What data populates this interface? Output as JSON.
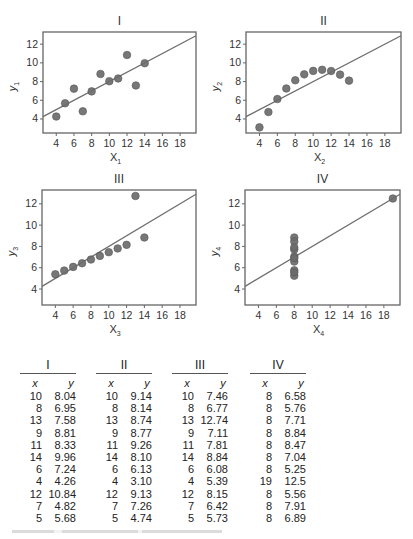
{
  "chart_data": [
    {
      "type": "scatter",
      "title": "I",
      "xlabel": "X1",
      "ylabel": "Y1",
      "xlim": [
        2.5,
        19.8
      ],
      "ylim": [
        2.5,
        13.3
      ],
      "xticks": [
        4,
        6,
        8,
        10,
        12,
        14,
        16,
        18
      ],
      "yticks": [
        4,
        6,
        8,
        10,
        12
      ],
      "x": [
        10,
        8,
        13,
        9,
        11,
        14,
        6,
        4,
        12,
        7,
        5
      ],
      "y": [
        8.04,
        6.95,
        7.58,
        8.81,
        8.33,
        9.96,
        7.24,
        4.26,
        10.84,
        4.82,
        5.68
      ],
      "fit_line": {
        "intercept": 3.0,
        "slope": 0.5
      },
      "grid": false
    },
    {
      "type": "scatter",
      "title": "II",
      "xlabel": "X2",
      "ylabel": "Y2",
      "xlim": [
        2.5,
        19.8
      ],
      "ylim": [
        2.5,
        13.3
      ],
      "xticks": [
        4,
        6,
        8,
        10,
        12,
        14,
        16,
        18
      ],
      "yticks": [
        4,
        6,
        8,
        10,
        12
      ],
      "x": [
        10,
        8,
        13,
        9,
        11,
        14,
        6,
        4,
        12,
        7,
        5
      ],
      "y": [
        9.14,
        8.14,
        8.74,
        8.77,
        9.26,
        8.1,
        6.13,
        3.1,
        9.13,
        7.26,
        4.74
      ],
      "fit_line": {
        "intercept": 3.0,
        "slope": 0.5
      },
      "grid": false
    },
    {
      "type": "scatter",
      "title": "III",
      "xlabel": "X3",
      "ylabel": "Y3",
      "xlim": [
        2.5,
        19.8
      ],
      "ylim": [
        2.5,
        13.3
      ],
      "xticks": [
        4,
        6,
        8,
        10,
        12,
        14,
        16,
        18
      ],
      "yticks": [
        4,
        6,
        8,
        10,
        12
      ],
      "x": [
        10,
        8,
        13,
        9,
        11,
        14,
        6,
        4,
        12,
        7,
        5
      ],
      "y": [
        7.46,
        6.77,
        12.74,
        7.11,
        7.81,
        8.84,
        6.08,
        5.39,
        8.15,
        6.42,
        5.73
      ],
      "fit_line": {
        "intercept": 3.0,
        "slope": 0.5
      },
      "grid": false
    },
    {
      "type": "scatter",
      "title": "IV",
      "xlabel": "X4",
      "ylabel": "Y4",
      "xlim": [
        2.5,
        19.8
      ],
      "ylim": [
        2.5,
        13.3
      ],
      "xticks": [
        4,
        6,
        8,
        10,
        12,
        14,
        16,
        18
      ],
      "yticks": [
        4,
        6,
        8,
        10,
        12
      ],
      "x": [
        8,
        8,
        8,
        8,
        8,
        8,
        8,
        19,
        8,
        8,
        8
      ],
      "y": [
        6.58,
        5.76,
        7.71,
        8.84,
        8.47,
        7.04,
        5.25,
        12.5,
        5.56,
        7.91,
        6.89
      ],
      "fit_line": {
        "intercept": 3.0,
        "slope": 0.5
      },
      "grid": false
    }
  ],
  "table": {
    "sets": [
      {
        "title": "I",
        "x_header": "x",
        "y_header": "y",
        "x": [
          "10",
          "8",
          "13",
          "9",
          "11",
          "14",
          "6",
          "4",
          "12",
          "7",
          "5"
        ],
        "y": [
          "8.04",
          "6.95",
          "7.58",
          "8.81",
          "8.33",
          "9.96",
          "7.24",
          "4.26",
          "10.84",
          "4.82",
          "5.68"
        ]
      },
      {
        "title": "II",
        "x_header": "x",
        "y_header": "y",
        "x": [
          "10",
          "8",
          "13",
          "9",
          "11",
          "14",
          "6",
          "4",
          "12",
          "7",
          "5"
        ],
        "y": [
          "9.14",
          "8.14",
          "8.74",
          "8.77",
          "9.26",
          "8.10",
          "6.13",
          "3.10",
          "9.13",
          "7.26",
          "4.74"
        ]
      },
      {
        "title": "III",
        "x_header": "x",
        "y_header": "y",
        "x": [
          "10",
          "8",
          "13",
          "9",
          "11",
          "14",
          "6",
          "4",
          "12",
          "7",
          "5"
        ],
        "y": [
          "7.46",
          "6.77",
          "12.74",
          "7.11",
          "7.81",
          "8.84",
          "6.08",
          "5.39",
          "8.15",
          "6.42",
          "5.73"
        ]
      },
      {
        "title": "IV",
        "x_header": "x",
        "y_header": "y",
        "x": [
          "8",
          "8",
          "8",
          "8",
          "8",
          "8",
          "8",
          "19",
          "8",
          "8",
          "8"
        ],
        "y": [
          "6.58",
          "5.76",
          "7.71",
          "8.84",
          "8.47",
          "7.04",
          "5.25",
          "12.5",
          "5.56",
          "7.91",
          "6.89"
        ]
      }
    ]
  },
  "colors": {
    "point": "#6b6b6b",
    "line": "#6e6e6e",
    "frame": "#666666",
    "text": "#333333"
  }
}
